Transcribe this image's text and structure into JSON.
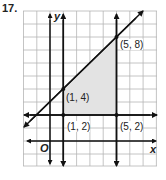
{
  "problem_number": "17.",
  "axes": {
    "x_label": "x",
    "y_label": "y",
    "origin_label": "O"
  },
  "grid": {
    "x_min": -2,
    "x_max": 8,
    "y_min": -2,
    "y_max": 10
  },
  "points": [
    {
      "label": "(5, 8)",
      "x": 5,
      "y": 8
    },
    {
      "label": "(1, 4)",
      "x": 1,
      "y": 4
    },
    {
      "label": "(1, 2)",
      "x": 1,
      "y": 2
    },
    {
      "label": "(5, 2)",
      "x": 5,
      "y": 2
    }
  ],
  "lines": [
    {
      "name": "y = x + 3",
      "type": "slanted"
    },
    {
      "name": "x = 1",
      "type": "vertical"
    },
    {
      "name": "x = 5",
      "type": "vertical"
    },
    {
      "name": "y = 2",
      "type": "horizontal"
    }
  ],
  "shaded_region": {
    "vertices": [
      "(1, 4)",
      "(5, 8)",
      "(5, 2)",
      "(1, 2)"
    ],
    "color": "#e3e3e3"
  }
}
